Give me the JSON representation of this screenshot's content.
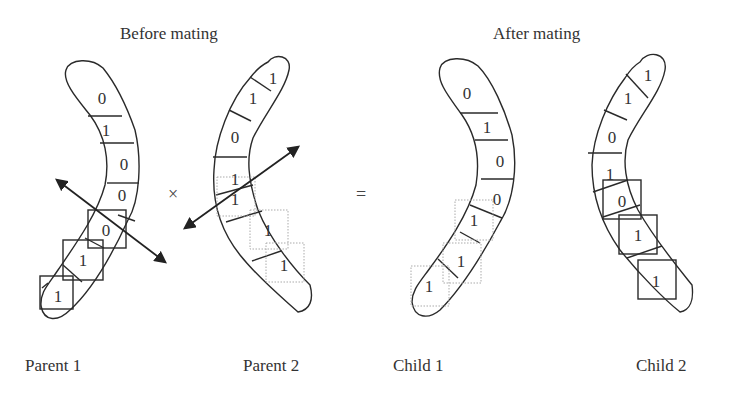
{
  "titles": {
    "before": "Before mating",
    "after": "After mating"
  },
  "operators": {
    "cross": "×",
    "equals": "="
  },
  "labels": {
    "parent1": "Parent 1",
    "parent2": "Parent 2",
    "child1": "Child 1",
    "child2": "Child 2"
  },
  "chromosomes": {
    "parent1": {
      "genes": [
        "0",
        "1",
        "0",
        "0",
        "0",
        "1",
        "1"
      ],
      "crossover_box_style": "solid"
    },
    "parent2": {
      "genes": [
        "1",
        "1",
        "0",
        "1",
        "1",
        "1",
        "1"
      ],
      "crossover_box_style": "dotted"
    },
    "child1": {
      "genes": [
        "0",
        "1",
        "0",
        "0",
        "1",
        "1",
        "1"
      ],
      "crossover_box_style": "dotted"
    },
    "child2": {
      "genes": [
        "1",
        "1",
        "0",
        "1",
        "0",
        "1",
        "1"
      ],
      "crossover_box_style": "solid"
    }
  },
  "colors": {
    "stroke": "#2a2a2a",
    "dotted": "#aaaaaa"
  }
}
